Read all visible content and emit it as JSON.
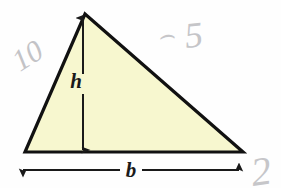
{
  "figure": {
    "name": "triangle-area-diagram",
    "background_color": "#fefefe",
    "paper_tint": "#fbfbfb"
  },
  "triangle": {
    "fill_color": "#f7f7cf",
    "stroke_color": "#111111",
    "stroke_width": 3.2,
    "vertices": {
      "apex": {
        "x": 85,
        "y": 14
      },
      "bottom_left": {
        "x": 25,
        "y": 152
      },
      "bottom_right": {
        "x": 243,
        "y": 152
      }
    }
  },
  "height_dimension": {
    "label": "h",
    "label_x": 76,
    "label_y": 88,
    "line_x": 83,
    "line_top_y": 18,
    "line_bottom_y": 150,
    "gap_top_y": 74,
    "gap_bottom_y": 94,
    "stroke_color": "#1a1a1a",
    "stroke_width": 2,
    "arrow_top": "up",
    "arrow_bottom": "down"
  },
  "base_dimension": {
    "label": "b",
    "label_x": 131,
    "label_y": 177,
    "line_y": 170,
    "line_left_x": 23,
    "line_right_x": 239,
    "gap_left_x": 120,
    "gap_right_x": 142,
    "stroke_color": "#1a1a1a",
    "stroke_width": 2,
    "arrow_left": "left",
    "arrow_right": "right"
  },
  "pencil_marks": [
    {
      "name": "pencil-mark-ten",
      "text": "10",
      "x": 20,
      "y": 72,
      "rotation": -32,
      "font_size": 30,
      "color": "#c3c3c8",
      "opacity": 0.85
    },
    {
      "name": "pencil-mark-curve",
      "text": "⌢",
      "x": 158,
      "y": 44,
      "rotation": -4,
      "font_size": 26,
      "color": "#cdcdd2",
      "opacity": 0.8
    },
    {
      "name": "pencil-mark-five",
      "text": "5",
      "x": 186,
      "y": 48,
      "rotation": -6,
      "font_size": 36,
      "color": "#c8c8cd",
      "opacity": 0.82
    },
    {
      "name": "pencil-mark-two",
      "text": "2",
      "x": 253,
      "y": 186,
      "rotation": -8,
      "font_size": 40,
      "color": "#cfcfd4",
      "opacity": 0.8
    }
  ],
  "chart_data": {
    "type": "diagram",
    "shape": "triangle",
    "labels": [
      "h",
      "b"
    ],
    "annotations": [
      "10",
      "5",
      "2"
    ]
  }
}
